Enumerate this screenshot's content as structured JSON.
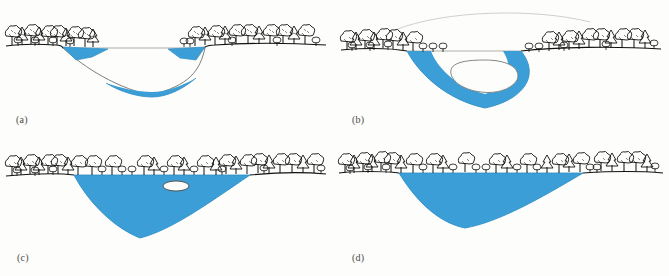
{
  "figure": {
    "background_color": "#fdfdfb",
    "water_color": "#3c9ed6",
    "water_color_dark": "#2e8ec6",
    "ink_color": "#111111",
    "ghost_line_color": "#b9b9b4",
    "label_color": "#4a4a48"
  },
  "panels": [
    {
      "id": "a",
      "label": "(a)",
      "caption_text": "(a)",
      "description": "Deep V-shaped valley cross-section with narrow strip of water at the base and small blue wedges perched on both valley shoulders; thin horizontal line marks former water surface level.",
      "water_bodies": 3,
      "has_island": false,
      "has_ghost_surface_line": true,
      "tree_count": 26
    },
    {
      "id": "b",
      "label": "(b)",
      "caption_text": "(b)",
      "description": "Valley partly filled: ring of water surrounds a white lens-shaped island/ice mass at the centre; faint arcing ghost outline above marks former ice surface.",
      "water_bodies": 1,
      "has_island": true,
      "has_ghost_surface_line": true,
      "tree_count": 30
    },
    {
      "id": "c",
      "label": "(c)",
      "caption_text": "(c)",
      "description": "Valley filled with water to the tree line; one small white island remains near the centre-right of the lake surface.",
      "water_bodies": 1,
      "has_island": true,
      "has_ghost_surface_line": false,
      "tree_count": 31
    },
    {
      "id": "d",
      "label": "(d)",
      "caption_text": "(d)",
      "description": "Broad shallow lake completely filling the basin, no islands remaining; continuous forested shoreline across the top.",
      "water_bodies": 1,
      "has_island": false,
      "has_ghost_surface_line": false,
      "tree_count": 33
    }
  ]
}
